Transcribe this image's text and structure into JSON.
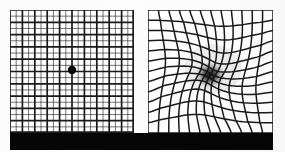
{
  "figure": {
    "background_color": "#fdfdfd",
    "base_bar_color": "#060606",
    "grid_line_color": "#1a1a1a",
    "panel_background": "#ffffff"
  },
  "panels": [
    {
      "id": "normal",
      "label": "Normal vision Amsler grid",
      "caption": "",
      "x": 10,
      "y": 10,
      "width": 124,
      "height": 123,
      "grid": {
        "major_lines": 11,
        "minor_lines_between": 1,
        "major_stroke": 1.7,
        "minor_stroke": 0.7,
        "distorted": false
      },
      "fixation_dot": {
        "label": "central fixation dot",
        "cx": 62,
        "cy": 60,
        "r": 4.2,
        "color": "#000000"
      },
      "scotoma": null
    },
    {
      "id": "distorted",
      "label": "Distorted vision Amsler grid with central scotoma",
      "caption": "",
      "x": 148,
      "y": 10,
      "width": 125,
      "height": 123,
      "grid": {
        "major_lines": 13,
        "minor_lines_between": 0,
        "major_stroke": 1.5,
        "minor_stroke": 0,
        "distorted": true
      },
      "fixation_dot": null,
      "scotoma": {
        "label": "central dark scotoma blur",
        "cx": 62,
        "cy": 65,
        "rx": 15,
        "ry": 13,
        "color": "#111111",
        "warp_strength": 0.62,
        "warp_radius": 52
      }
    }
  ],
  "base_bar": {
    "label": "black base bar",
    "x": 10,
    "y": 133,
    "width": 263,
    "height": 17
  },
  "chart_data": {
    "type": "diagram",
    "series": [
      {
        "name": "normal grid",
        "description": "uniform square lattice, 11 major lines per axis with one thin line between each, central fixation dot"
      },
      {
        "name": "distorted grid",
        "description": "13 lines per axis pulled radially inward toward a dark central scotoma, simulating macular degeneration"
      }
    ]
  }
}
